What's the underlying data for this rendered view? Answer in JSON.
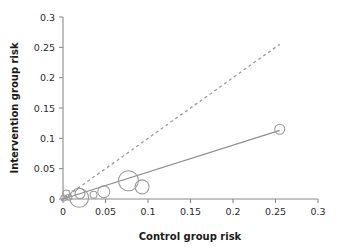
{
  "chart_data": {
    "type": "scatter",
    "title": "",
    "xlabel": "Control group risk",
    "ylabel": "Intervention group risk",
    "xlim": [
      0,
      0.3
    ],
    "ylim": [
      0,
      0.3
    ],
    "grid": false,
    "legend": "none",
    "xticks": [
      "0",
      "0.05",
      "0.1",
      "0.15",
      "0.2",
      "0.25",
      "0.3"
    ],
    "xtick_values": [
      0,
      0.05,
      0.1,
      0.15,
      0.2,
      0.25,
      0.3
    ],
    "yticks": [
      "0",
      "0.05",
      "0.1",
      "0.15",
      "0.2",
      "0.25",
      "0.3"
    ],
    "ytick_values": [
      0,
      0.05,
      0.1,
      0.15,
      0.2,
      0.25,
      0.3
    ],
    "marker_style": "open-circle",
    "marker_color": "#9a9a9a",
    "bubbles": [
      {
        "x": 0.001,
        "y": 0.0015,
        "size": 3.0
      },
      {
        "x": 0.004,
        "y": 0.009,
        "size": 3.5
      },
      {
        "x": 0.007,
        "y": 0.003,
        "size": 3.0
      },
      {
        "x": 0.019,
        "y": 0.002,
        "size": 9.5
      },
      {
        "x": 0.02,
        "y": 0.009,
        "size": 5.0
      },
      {
        "x": 0.036,
        "y": 0.007,
        "size": 3.5
      },
      {
        "x": 0.048,
        "y": 0.012,
        "size": 6.0
      },
      {
        "x": 0.077,
        "y": 0.03,
        "size": 10.0
      },
      {
        "x": 0.093,
        "y": 0.02,
        "size": 7.0
      },
      {
        "x": 0.255,
        "y": 0.115,
        "size": 5.0
      }
    ],
    "series": [
      {
        "name": "regression-line",
        "type": "line",
        "style": "solid",
        "color": "#8f8f8f",
        "x": [
          0,
          0.255
        ],
        "y": [
          0.0,
          0.113
        ]
      },
      {
        "name": "line-of-equality",
        "type": "line",
        "style": "dashed",
        "color": "#9a9a9a",
        "x": [
          0,
          0.255
        ],
        "y": [
          0,
          0.255
        ]
      }
    ]
  }
}
